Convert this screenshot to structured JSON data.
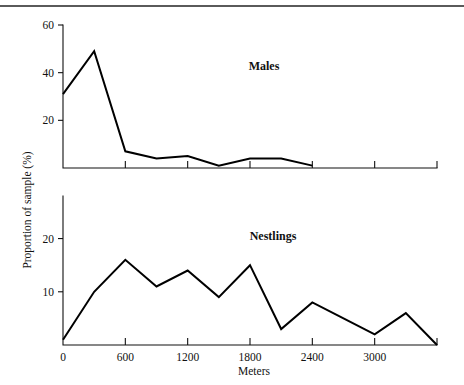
{
  "figure": {
    "background_color": "#ffffff",
    "ink_color": "#000000",
    "rule_color": "#5a5a5a",
    "shared_ylabel": "Proportion of sample (%)",
    "shared_xlabel": "Meters"
  },
  "chart_data": [
    {
      "type": "line",
      "title": "Males",
      "xlabel": "Meters",
      "ylabel": "Proportion of sample (%)",
      "xlim": [
        0,
        3600
      ],
      "ylim": [
        0,
        60
      ],
      "xticks": [
        0,
        600,
        1200,
        1800,
        2400,
        3000
      ],
      "xtick_labels": [
        "0",
        "600",
        "1200",
        "1800",
        "2400",
        "3000"
      ],
      "yticks": [
        20,
        40,
        60
      ],
      "ytick_labels": [
        "20",
        "40",
        "60"
      ],
      "grid": false,
      "legend": "none",
      "x": [
        0,
        300,
        600,
        900,
        1200,
        1500,
        1800,
        2100,
        2400
      ],
      "values": [
        31,
        49,
        7,
        4,
        5,
        1,
        4,
        4,
        1
      ]
    },
    {
      "type": "line",
      "title": "Nestlings",
      "xlabel": "Meters",
      "ylabel": "Proportion of sample (%)",
      "xlim": [
        0,
        3600
      ],
      "ylim": [
        0,
        28
      ],
      "xticks": [
        0,
        600,
        1200,
        1800,
        2400,
        3000
      ],
      "xtick_labels": [
        "0",
        "600",
        "1200",
        "1800",
        "2400",
        "3000"
      ],
      "yticks": [
        10,
        20
      ],
      "ytick_labels": [
        "10",
        "20"
      ],
      "grid": false,
      "legend": "none",
      "x": [
        0,
        300,
        600,
        900,
        1200,
        1500,
        1800,
        2100,
        2400,
        2700,
        3000,
        3300,
        3600
      ],
      "values": [
        1,
        10,
        16,
        11,
        14,
        9,
        15,
        3,
        8,
        5,
        2,
        6,
        0
      ]
    }
  ]
}
